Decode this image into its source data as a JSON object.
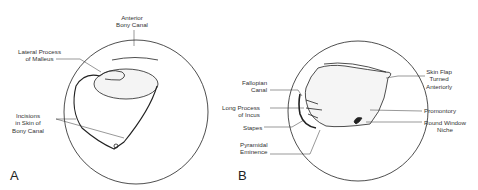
{
  "figure": {
    "panel_a": {
      "letter": "A",
      "labels": {
        "anterior_bony_canal": "Anterior\nBony Canal",
        "lateral_process_of_malleus": "Lateral Process\nof Malleus",
        "incisions_in_skin": "Incisions\nin Skin of\nBony Canal"
      }
    },
    "panel_b": {
      "letter": "B",
      "labels": {
        "fallopian_canal": "Fallopian\nCanal",
        "long_process_of_incus": "Long Process\nof Incus",
        "stapes": "Stapes",
        "pyramidal_eminence": "Pyramidal\nEminence",
        "skin_flap": "Skin Flap\nTurned\nAnteriorly",
        "promontory": "Promontory",
        "round_window_niche": "Round Window\nNiche"
      }
    },
    "colors": {
      "line": "#222222",
      "text": "#333333",
      "background": "#ffffff"
    }
  }
}
